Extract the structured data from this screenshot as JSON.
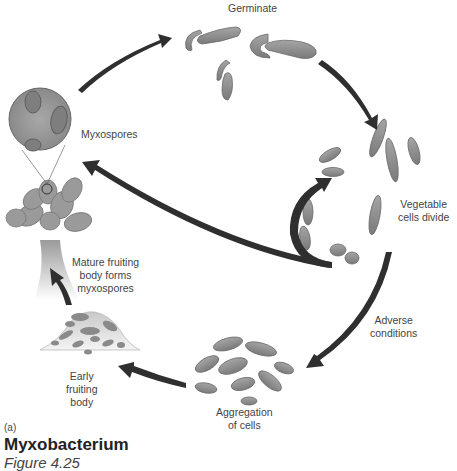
{
  "figure": {
    "panel_letter": "(a)",
    "title": "Myxobacterium",
    "caption": "Figure 4.25"
  },
  "stages": {
    "germinate": "Germinate",
    "vegetable_cells_divide": "Vegetable\ncells divide",
    "adverse_conditions": "Adverse\nconditions",
    "aggregation": "Aggregation\nof cells",
    "early_fruiting_body": "Early\nfruiting\nbody",
    "mature_fruiting_body": "Mature fruiting\nbody forms\nmyxospores",
    "myxospores": "Myxospores"
  },
  "colors": {
    "cell_fill": "#8a8a8a",
    "cell_edge": "#666666",
    "arrow": "#2f2f2f",
    "spore_bg": "#9c9c9c",
    "text": "#444444"
  }
}
